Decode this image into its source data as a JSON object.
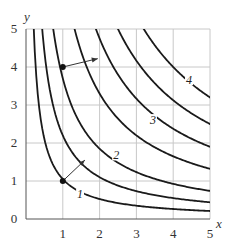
{
  "chart_data": {
    "type": "line",
    "title": "",
    "xlabel": "x",
    "ylabel": "y",
    "xlim": [
      0,
      5
    ],
    "ylim": [
      0,
      5
    ],
    "grid": true,
    "x_ticks": [
      "1",
      "2",
      "3",
      "4",
      "5"
    ],
    "y_ticks": [
      "0",
      "1",
      "2",
      "3",
      "4",
      "5"
    ],
    "series": [
      {
        "name": "level curve 1",
        "label": "1",
        "c": 1.05
      },
      {
        "name": "level curve (unlabeled)",
        "label": "",
        "c": 2.2
      },
      {
        "name": "level curve 2",
        "label": "2",
        "c": 3.7
      },
      {
        "name": "level curve (unlabeled)",
        "label": "",
        "c": 6.6
      },
      {
        "name": "level curve 3",
        "label": "3",
        "c": 9.5
      },
      {
        "name": "level curve (unlabeled)",
        "label": "",
        "c": 12.5
      },
      {
        "name": "level curve 4",
        "label": "4",
        "c": 16
      }
    ],
    "curve_labels": [
      {
        "text": "1",
        "x": 1.47,
        "y": 0.6
      },
      {
        "text": "2",
        "x": 2.45,
        "y": 1.62
      },
      {
        "text": "3",
        "x": 3.45,
        "y": 2.55
      },
      {
        "text": "4",
        "x": 4.43,
        "y": 3.6
      }
    ],
    "points": [
      {
        "x": 1,
        "y": 1
      },
      {
        "x": 1,
        "y": 4
      }
    ],
    "arrows": [
      {
        "from": [
          1,
          1
        ],
        "to": [
          1.6,
          1.55
        ]
      },
      {
        "from": [
          1,
          4
        ],
        "to": [
          1.95,
          4.22
        ]
      }
    ]
  }
}
